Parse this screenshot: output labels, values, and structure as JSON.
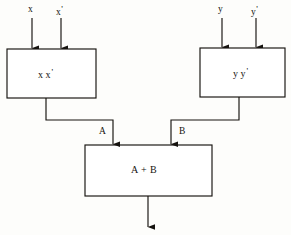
{
  "diagram": {
    "colors": {
      "background": "#fdfdfb",
      "stroke": "#16130f",
      "text": "#16130f",
      "box_fill": "#ffffff"
    },
    "inputs": [
      {
        "id": "x",
        "label": "x",
        "prime": "",
        "x": 32
      },
      {
        "id": "x-prime",
        "label": "x",
        "prime": "'",
        "x": 61
      },
      {
        "id": "y",
        "label": "y",
        "prime": "",
        "x": 222
      },
      {
        "id": "y-prime",
        "label": "y",
        "prime": "'",
        "x": 256
      }
    ],
    "blocks": [
      {
        "id": "block-xx",
        "label": "x",
        "prime": "'",
        "text": "x x'",
        "x": 7,
        "y": 49,
        "w": 89,
        "h": 49
      },
      {
        "id": "block-yy",
        "label": "y",
        "prime": "'",
        "text": "y y'",
        "x": 200,
        "y": 48,
        "w": 85,
        "h": 49
      },
      {
        "id": "block-sum",
        "label": "A + B",
        "text": "A + B",
        "x": 85,
        "y": 145,
        "w": 127,
        "h": 51
      }
    ],
    "intermediate_signals": [
      {
        "id": "signal-a",
        "label": "A"
      },
      {
        "id": "signal-b",
        "label": "B"
      }
    ],
    "output": {
      "id": "output-arrow",
      "label": ""
    }
  }
}
